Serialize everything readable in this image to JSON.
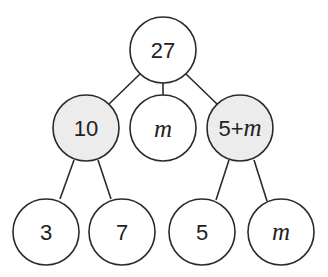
{
  "diagram": {
    "type": "tree",
    "colors": {
      "stroke": "#2a2a2a",
      "fill_plain": "#ffffff",
      "fill_shaded": "#ececec"
    },
    "nodes": [
      {
        "id": "root",
        "label": "27",
        "italic": false,
        "shaded": false,
        "cx": 163,
        "cy": 50
      },
      {
        "id": "n10",
        "label": "10",
        "italic": false,
        "shaded": true,
        "cx": 86,
        "cy": 128
      },
      {
        "id": "nm",
        "label": "m",
        "italic": true,
        "shaded": false,
        "cx": 163,
        "cy": 128
      },
      {
        "id": "n5m_a",
        "label": "5+",
        "label_var": "m",
        "italic": false,
        "shaded": true,
        "cx": 240,
        "cy": 128
      },
      {
        "id": "n3",
        "label": "3",
        "italic": false,
        "shaded": false,
        "cx": 46,
        "cy": 232
      },
      {
        "id": "n7",
        "label": "7",
        "italic": false,
        "shaded": false,
        "cx": 122,
        "cy": 232
      },
      {
        "id": "n5",
        "label": "5",
        "italic": false,
        "shaded": false,
        "cx": 202,
        "cy": 232
      },
      {
        "id": "nm2",
        "label": "m",
        "italic": true,
        "shaded": false,
        "cx": 281,
        "cy": 232
      }
    ],
    "edges": [
      [
        "root",
        "n10"
      ],
      [
        "root",
        "nm"
      ],
      [
        "root",
        "n5m_a"
      ],
      [
        "n10",
        "n3"
      ],
      [
        "n10",
        "n7"
      ],
      [
        "n5m_a",
        "n5"
      ],
      [
        "n5m_a",
        "nm2"
      ]
    ]
  }
}
